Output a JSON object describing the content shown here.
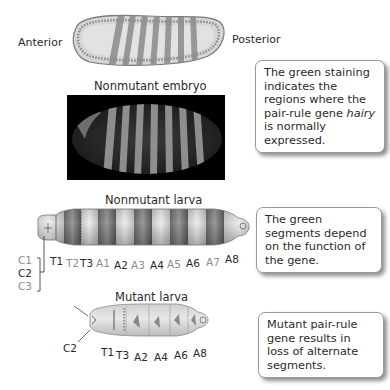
{
  "top_embryo": {
    "anterior_label": "Anterior",
    "posterior_label": "Posterior",
    "stripe_count": 7
  },
  "nonmutant_embryo": {
    "title": "Nonmutant embryo",
    "stripe_count": 7
  },
  "callouts": {
    "staining": {
      "before": "The green staining indicates the regions where the pair-rule gene ",
      "italic": "hairy",
      "after": " is normally expressed."
    },
    "green_segments": "The green segments depend on the function of the gene.",
    "mutant": "Mutant pair-rule gene results in loss of alternate segments."
  },
  "nonmutant_larva": {
    "title": "Nonmutant larva",
    "segments": [
      {
        "label": "T1",
        "shade": "dark"
      },
      {
        "label": "T2",
        "shade": "light"
      },
      {
        "label": "T3",
        "shade": "dark"
      },
      {
        "label": "A1",
        "shade": "light"
      },
      {
        "label": "A2",
        "shade": "dark"
      },
      {
        "label": "A3",
        "shade": "light"
      },
      {
        "label": "A4",
        "shade": "dark"
      },
      {
        "label": "A5",
        "shade": "light"
      },
      {
        "label": "A6",
        "shade": "dark"
      },
      {
        "label": "A7",
        "shade": "light"
      },
      {
        "label": "A8",
        "shade": "dark"
      }
    ],
    "head_segments": [
      {
        "label": "C1",
        "shade": "light"
      },
      {
        "label": "C2",
        "shade": "dark"
      },
      {
        "label": "C3",
        "shade": "light"
      }
    ]
  },
  "mutant_larva": {
    "title": "Mutant larva",
    "head_label": "C2",
    "segments": [
      "T1",
      "T3",
      "A2",
      "A4",
      "A6",
      "A8"
    ]
  }
}
